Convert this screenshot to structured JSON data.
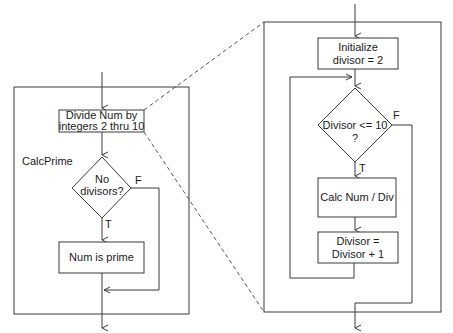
{
  "left_panel": {
    "label": "CalcPrime",
    "process_box": {
      "line1": "Divide Num by",
      "line2": "integers 2 thru 10"
    },
    "decision": {
      "line1": "No",
      "line2": "divisors?",
      "true_label": "T",
      "false_label": "F"
    },
    "result_box": {
      "text": "Num is prime"
    }
  },
  "right_panel": {
    "init_box": {
      "line1": "Initialize",
      "line2": "divisor = 2"
    },
    "decision": {
      "line1": "Divisor <= 10",
      "line2": "?",
      "true_label": "T",
      "false_label": "F"
    },
    "calc_box": {
      "text": "Calc Num / Div"
    },
    "increment_box": {
      "line1": "Divisor =",
      "line2": "Divisor + 1"
    }
  },
  "colors": {
    "line": "#3a3a3a",
    "background": "#ffffff",
    "dashed_connector": "#555555"
  }
}
